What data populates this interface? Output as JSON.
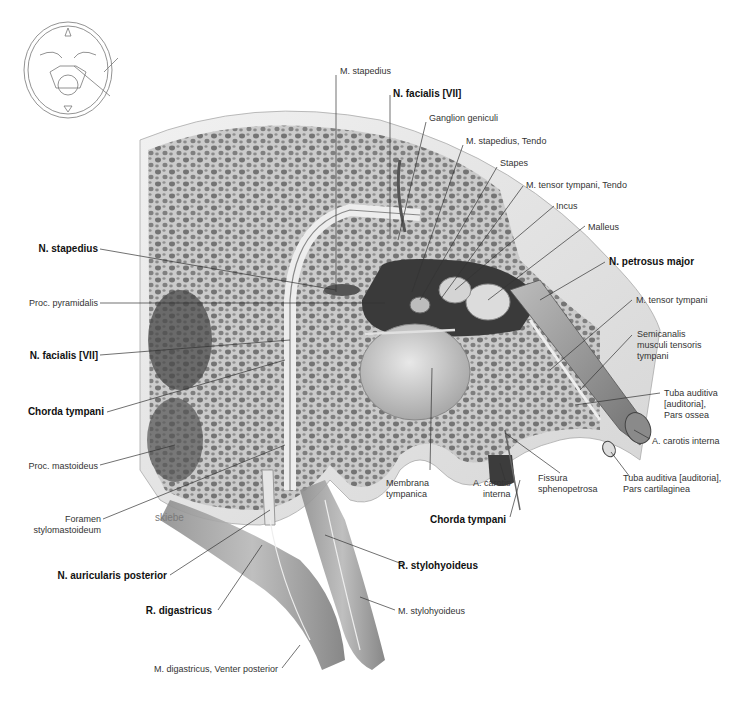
{
  "figure": {
    "signature": "skiebe",
    "orientation_inset": "skull-base-orientation-sketch",
    "labels": {
      "m_stapedius": "M. stapedius",
      "n_facialis_top": "N. facialis [VII]",
      "ganglion_geniculi": "Ganglion geniculi",
      "m_stapedius_tendo": "M. stapedius, Tendo",
      "stapes": "Stapes",
      "m_tensor_tympani_tendo": "M. tensor tympani, Tendo",
      "incus": "Incus",
      "malleus": "Malleus",
      "n_petrosus_major": "N. petrosus major",
      "m_tensor_tympani": "M. tensor tympani",
      "semicanalis": "Semicanalis\nmusculi tensoris\ntympani",
      "tuba_ossea": "Tuba auditiva\n[auditoria],\nPars ossea",
      "a_carotis_interna_right": "A. carotis interna",
      "tuba_cartilaginea": "Tuba auditiva [auditoria],\nPars cartilaginea",
      "fissura": "Fissura\nsphenopetrosa",
      "a_carotis_interna_mid": "A. carotis\ninterna",
      "membrana_tympanica": "Membrana\ntympanica",
      "chorda_tympani_bottom": "Chorda tympani",
      "n_stapedius": "N. stapedius",
      "proc_pyramidalis": "Proc. pyramidalis",
      "n_facialis_left": "N. facialis [VII]",
      "chorda_tympani_left": "Chorda tympani",
      "proc_mastoideus": "Proc. mastoideus",
      "foramen": "Foramen\nstylomastoideum",
      "n_auricularis": "N. auricularis posterior",
      "r_stylohyoideus": "R. stylohyoideus",
      "r_digastricus": "R. digastricus",
      "m_stylohyoideus": "M. stylohyoideus",
      "m_digastricus": "M. digastricus, Venter posterior"
    }
  }
}
